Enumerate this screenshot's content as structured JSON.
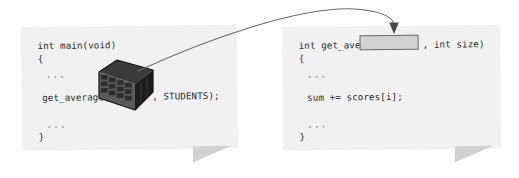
{
  "diagram": {
    "background_color": "#ffffff",
    "card_color": "#f1f1f1",
    "accent_color": "#6d6d6d",
    "text_color": "#2b2b2b",
    "ellipsis": "..."
  },
  "left_card": {
    "name": "caller-code-card",
    "lines": {
      "signature": "int main(void)",
      "open_brace": "{",
      "ellipsis_top": "...",
      "call_prefix": "get_average(",
      "call_suffix": ", STUDENTS);",
      "ellipsis_bottom": "...",
      "close_brace": "}"
    },
    "array_icon": {
      "name": "array-crate-icon",
      "label": "scores array",
      "rows": 4,
      "cols": 5
    }
  },
  "right_card": {
    "name": "callee-code-card",
    "lines": {
      "signature_prefix": "int get_average(",
      "signature_suffix": ", int size)",
      "open_brace": "{",
      "ellipsis_top": "...",
      "body": "sum += scores[i];",
      "ellipsis_bottom": "...",
      "close_brace": "}"
    },
    "parameter_slot": {
      "name": "array-parameter-slot",
      "value": "",
      "fill_color": "#d2d2d2",
      "border_color": "#6d6d6d"
    }
  },
  "arrow": {
    "name": "array-passing-arrow",
    "from": "array-crate-icon",
    "to": "array-parameter-slot",
    "color": "#6b6b6b"
  }
}
